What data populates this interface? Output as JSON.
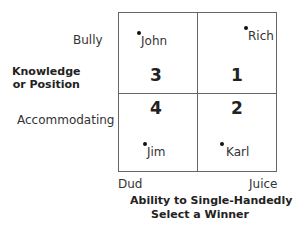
{
  "diagram": {
    "y_axis": {
      "title": "Knowledge\nor Position",
      "title_line1": "Knowledge",
      "title_line2": "or Position",
      "top_label": "Bully",
      "bottom_label": "Accommodating"
    },
    "x_axis": {
      "title_line1": "Ability to Single-Handedly",
      "title_line2": "Select a Winner",
      "left_label": "Dud",
      "right_label": "Juice"
    },
    "quadrants": [
      {
        "position": "top-left",
        "number": "3"
      },
      {
        "position": "top-right",
        "number": "1"
      },
      {
        "position": "bottom-left",
        "number": "4"
      },
      {
        "position": "bottom-right",
        "number": "2"
      }
    ],
    "people": [
      {
        "name": "John",
        "quadrant": "3"
      },
      {
        "name": "Rich",
        "quadrant": "1"
      },
      {
        "name": "Jim",
        "quadrant": "4"
      },
      {
        "name": "Karl",
        "quadrant": "2"
      }
    ]
  }
}
